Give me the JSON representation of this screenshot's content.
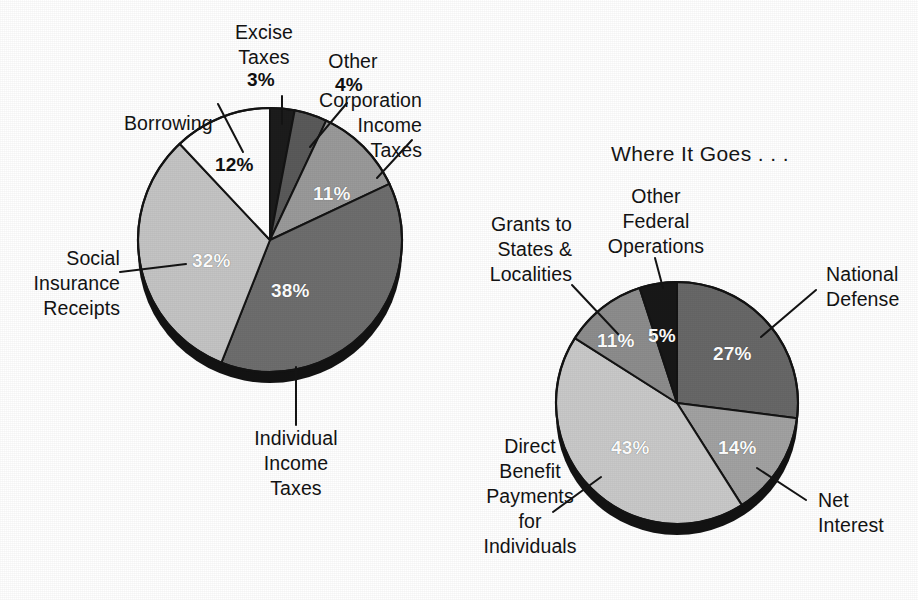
{
  "figure": {
    "background_color": "#ffffff",
    "text_color": "#131313"
  },
  "titles": {
    "right_chart_title": "Where It Goes . . ."
  },
  "chart_data": [
    {
      "type": "pie",
      "name": "where-it-comes-from",
      "title": "",
      "center": [
        270,
        240
      ],
      "radius": 132,
      "start_angle_deg": 0,
      "direction": "clockwise",
      "legend": "callout-labels",
      "categories": [
        "Excise Taxes",
        "Other",
        "Corporation Income Taxes",
        "Individual Income Taxes",
        "Social Insurance Receipts",
        "Borrowing"
      ],
      "values": [
        3,
        4,
        11,
        38,
        32,
        12
      ],
      "value_labels": [
        "3%",
        "4%",
        "11%",
        "38%",
        "32%",
        "12%"
      ],
      "colors": [
        "#1c1c1c",
        "#5a5a5a",
        "#9a9a9a",
        "#6e6e6e",
        "#c4c4c4",
        "#ffffff"
      ],
      "label_colors": [
        "#111111",
        "#111111",
        "#ffffff",
        "#ffffff",
        "#ffffff",
        "#111111"
      ]
    },
    {
      "type": "pie",
      "name": "where-it-goes",
      "title": "Where It Goes . . .",
      "center": [
        677,
        403
      ],
      "radius": 121,
      "start_angle_deg": 0,
      "direction": "clockwise",
      "legend": "callout-labels",
      "categories": [
        "National Defense",
        "Net Interest",
        "Direct Benefit Payments for Individuals",
        "Grants to States & Localities",
        "Other Federal Operations"
      ],
      "values": [
        27,
        14,
        43,
        11,
        5
      ],
      "value_labels": [
        "27%",
        "14%",
        "43%",
        "11%",
        "5%"
      ],
      "colors": [
        "#686868",
        "#a2a2a2",
        "#c9c9c9",
        "#8d8d8d",
        "#181818"
      ],
      "label_colors": [
        "#ffffff",
        "#ffffff",
        "#ffffff",
        "#ffffff",
        "#ffffff"
      ]
    }
  ],
  "left_chart": {
    "labels": {
      "excise_taxes": "Excise\nTaxes",
      "other": "Other",
      "corporation_income_taxes": "Corporation\nIncome\nTaxes",
      "individual_income_taxes": "Individual\nIncome\nTaxes",
      "social_insurance_receipts": "Social\nInsurance\nReceipts",
      "borrowing": "Borrowing"
    },
    "percents": {
      "excise_taxes": "3%",
      "other": "4%",
      "corporation_income_taxes": "11%",
      "individual_income_taxes": "38%",
      "social_insurance_receipts": "32%",
      "borrowing": "12%"
    }
  },
  "right_chart": {
    "labels": {
      "other_federal_operations": "Other\nFederal\nOperations",
      "grants_to_states": "Grants to\nStates &\nLocalities",
      "national_defense": "National\nDefense",
      "net_interest": "Net\nInterest",
      "direct_benefit_payments": "Direct\nBenefit\nPayments\nfor\nIndividuals"
    },
    "percents": {
      "other_federal_operations": "5%",
      "grants_to_states": "11%",
      "national_defense": "27%",
      "net_interest": "14%",
      "direct_benefit_payments": "43%"
    }
  }
}
